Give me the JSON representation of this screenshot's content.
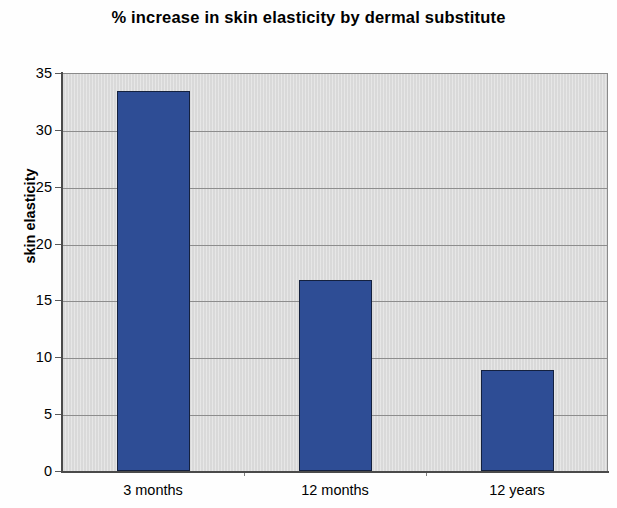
{
  "chart_data": {
    "type": "bar",
    "title": "% increase in skin elasticity by dermal substitute",
    "xlabel": "",
    "ylabel": "skin elasticity",
    "categories": [
      "3 months",
      "12 months",
      "12 years"
    ],
    "values": [
      33.4,
      16.8,
      8.9
    ],
    "ylim": [
      0,
      35
    ],
    "ytick_labels": [
      "0",
      "5",
      "10",
      "15",
      "20",
      "25",
      "30",
      "35"
    ],
    "ytick_values": [
      0,
      5,
      10,
      15,
      20,
      25,
      30,
      35
    ],
    "ytick_step": 5,
    "grid": "horizontal",
    "legend": null,
    "series": [
      {
        "name": "skin elasticity",
        "values": [
          33.4,
          16.8,
          8.9
        ],
        "color": "#2e4d95"
      }
    ],
    "bar_color": "#2e4d95",
    "bar_border_color": "#14213f",
    "plot_background": "#dcdcdc",
    "gridline_color": "#8d8d8d",
    "figure_background": "#fefefe"
  }
}
